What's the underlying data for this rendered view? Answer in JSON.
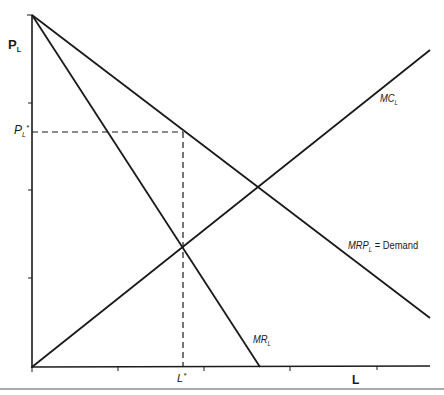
{
  "diagram": {
    "type": "monopsony-labor-market",
    "colors": {
      "line": "#1a1a1a",
      "rule": "#555555",
      "background": "#ffffff"
    },
    "axes": {
      "y_label": {
        "main": "P",
        "sub": "L"
      },
      "x_label": "L",
      "y_ticks_px": [
        15,
        103,
        190,
        278
      ],
      "x_ticks_px": [
        118,
        204,
        290,
        377
      ]
    },
    "curves": [
      {
        "id": "mrp",
        "label_main": "MRP",
        "label_sub": "L",
        "label_suffix": " = Demand",
        "from": [
          32,
          15
        ],
        "to": [
          430,
          318
        ]
      },
      {
        "id": "mr",
        "label_main": "MR",
        "label_sub": "L",
        "from": [
          32,
          15
        ],
        "to": [
          260,
          367
        ]
      },
      {
        "id": "mc",
        "label_main": "MC",
        "label_sub": "L",
        "from": [
          32,
          367
        ],
        "to": [
          430,
          50
        ]
      }
    ],
    "equilibrium": {
      "price_label": {
        "main": "P",
        "sub": "L",
        "sup": "*"
      },
      "quantity_label": {
        "main": "L",
        "sup": "*"
      },
      "price_y_px": 132,
      "quantity_x_px": 183
    }
  }
}
